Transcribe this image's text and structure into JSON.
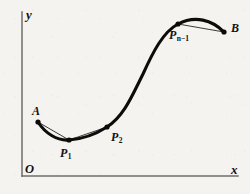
{
  "figure": {
    "background_color": "#f4f3f0",
    "curve_color": "#0d0c0b",
    "axis_color": "#6f6e6a",
    "axes": {
      "y_label": "y",
      "x_label": "x",
      "origin_label": "O",
      "x_axis": {
        "x1": 22,
        "y1": 176,
        "x2": 238,
        "y2": 176
      },
      "y_axis": {
        "x1": 22,
        "y1": 12,
        "x2": 22,
        "y2": 176
      }
    },
    "points": [
      {
        "id": "A",
        "label": "A",
        "sub": "",
        "x": 38,
        "y": 122
      },
      {
        "id": "P1",
        "label": "P",
        "sub": "1",
        "x": 69,
        "y": 140
      },
      {
        "id": "P2",
        "label": "P",
        "sub": "2",
        "x": 107,
        "y": 127
      },
      {
        "id": "Pn1",
        "label": "P",
        "sub": "n−1",
        "x": 178,
        "y": 24
      },
      {
        "id": "B",
        "label": "B",
        "sub": "",
        "x": 224,
        "y": 32
      }
    ],
    "curve_path": "M 38 122 C 45 133, 57 141, 69 140 C 83 139, 96 134, 107 127 C 124 116, 132 96, 143 74 C 153 52, 163 32, 178 24 C 195 15, 212 20, 224 32",
    "chords": [
      {
        "from": "A",
        "to": "P1",
        "path": "M 38 122 L 69 140"
      },
      {
        "from": "P1",
        "to": "P2",
        "path": "M 69 140 L 107 127"
      },
      {
        "from": "Pn1",
        "to": "B",
        "path": "M 178 24 L 224 32"
      }
    ],
    "dot_radius": 2.6
  }
}
